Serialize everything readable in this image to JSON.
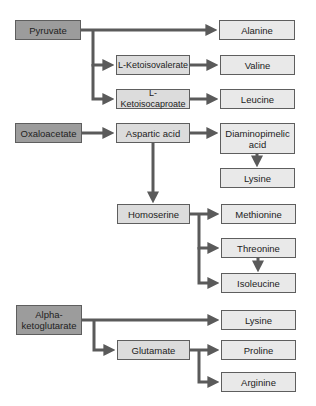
{
  "diagram": {
    "type": "biosynthesis-flow",
    "colors": {
      "source_fill": "#9c9c9c",
      "intermediate_fill": "#dcdcdc",
      "product_fill": "#e9e9e9",
      "arrow": "#5a5a5a",
      "border": "#5e5e5e"
    },
    "nodes": {
      "pyruvate": "Pyruvate",
      "alanine": "Alanine",
      "l_ketoisovalerate": "L-Ketoisovalerate",
      "valine": "Valine",
      "l_ketoisocaproate": "L-Ketoisocaproate",
      "leucine": "Leucine",
      "oxaloacetate": "Oxaloacetate",
      "aspartic_acid": "Aspartic acid",
      "diaminopimelic_acid": "Diaminopimelic acid",
      "lysine_1": "Lysine",
      "homoserine": "Homoserine",
      "methionine": "Methionine",
      "threonine": "Threonine",
      "isoleucine": "Isoleucine",
      "alpha_ketoglutarate": "Alpha-ketoglutarate",
      "lysine_2": "Lysine",
      "glutamate": "Glutamate",
      "proline": "Proline",
      "arginine": "Arginine"
    },
    "edges": [
      [
        "Pyruvate",
        "Alanine"
      ],
      [
        "Pyruvate",
        "L-Ketoisovalerate"
      ],
      [
        "Pyruvate",
        "L-Ketoisocaproate"
      ],
      [
        "L-Ketoisovalerate",
        "Valine"
      ],
      [
        "L-Ketoisocaproate",
        "Leucine"
      ],
      [
        "Oxaloacetate",
        "Aspartic acid"
      ],
      [
        "Aspartic acid",
        "Diaminopimelic acid"
      ],
      [
        "Diaminopimelic acid",
        "Lysine"
      ],
      [
        "Aspartic acid",
        "Homoserine"
      ],
      [
        "Homoserine",
        "Methionine"
      ],
      [
        "Homoserine",
        "Threonine"
      ],
      [
        "Threonine",
        "Isoleucine"
      ],
      [
        "Homoserine",
        "Isoleucine"
      ],
      [
        "Alpha-ketoglutarate",
        "Lysine"
      ],
      [
        "Alpha-ketoglutarate",
        "Glutamate"
      ],
      [
        "Glutamate",
        "Proline"
      ],
      [
        "Glutamate",
        "Arginine"
      ]
    ]
  }
}
